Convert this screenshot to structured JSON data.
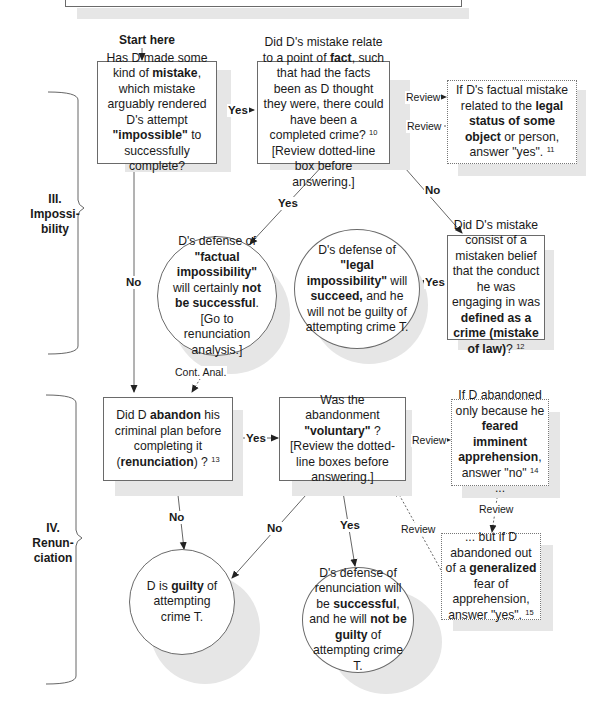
{
  "header_box": {
    "visible_text": ""
  },
  "start": {
    "label": "Start here"
  },
  "sections": [
    {
      "id": "III",
      "number": "III.",
      "title_line1": "Impossi-",
      "title_line2": "bility"
    },
    {
      "id": "IV",
      "number": "IV.",
      "title_line1": "Renun-",
      "title_line2": "ciation"
    }
  ],
  "nodes": {
    "q_mistake": {
      "t1": "Has D made some kind of ",
      "b1": "mistake",
      "t2": ", which mistake arguably rendered D's attempt ",
      "b2": "\"impossible\"",
      "t3": " to successfully complete?"
    },
    "q_fact": {
      "t1": "Did D's mistake relate to a point of ",
      "b1": "fact",
      "t2": ", such that had the facts been as D thought they were, there could have been a completed crime? ",
      "sup": "10",
      "t3": " [Review dotted-line box before answering.]"
    },
    "note_legal_status": {
      "t1": "If D's factual mistake related to the ",
      "b1": "legal status of some object",
      "t2": " or person, answer \"yes\". ",
      "sup": "11"
    },
    "r_factual": {
      "t1": "D's defense of ",
      "b1": "\"factual impossibility\"",
      "t2": " will certainly ",
      "b2": "not be successful",
      "t3": ". [Go to renunciation analysis.]"
    },
    "r_legal": {
      "t1": "D's defense of ",
      "b1": "\"legal impossibility\"",
      "t2": " will ",
      "b2": "succeed,",
      "t3": " and he will not be guilty of attempting crime T."
    },
    "q_law": {
      "t1": "Did D's mistake consist of a mistaken belief that the conduct he was engaging in was ",
      "b1": "defined as a crime (mistake of law)",
      "t2": "? ",
      "sup": "12"
    },
    "q_abandon": {
      "t1": "Did D ",
      "b1": "abandon",
      "t2": " his criminal plan before completing it (",
      "b2": "renunciation",
      "t3": ") ? ",
      "sup": "13"
    },
    "q_voluntary": {
      "b1": "\"voluntary\"",
      "t1": "Was the abandonment ",
      "t2": " ? [Review the dotted-line boxes before answering.]"
    },
    "note_imminent": {
      "t1": "If D abandoned only because he ",
      "b1": "feared imminent apprehension",
      "t2": ", answer \"no\" ",
      "sup": "14",
      "t3": " ..."
    },
    "note_generalized": {
      "t1": "... but if D abandoned out of a ",
      "b1": "generalized",
      "t2": " fear of apprehension, answer \"yes\". ",
      "sup": "15"
    },
    "r_guilty": {
      "t1": "D is ",
      "b1": "guilty",
      "t2": " of attempting crime T."
    },
    "r_renunciation": {
      "t1": "D's defense of renunciation will be ",
      "b1": "successful",
      "t2": ", and he will ",
      "b2": "not be guilty",
      "t3": " of attempting crime T."
    }
  },
  "edge_labels": {
    "yes_mistake_to_fact": "Yes",
    "review_out": "Review",
    "review_in": "Review",
    "no_fact_to_law": "No",
    "yes_fact_to_factual": "Yes",
    "no_mistake_to_abandon": "No",
    "yes_law_to_legal": "Yes",
    "cont_anal": "Cont. Anal.",
    "yes_abandon_to_voluntary": "Yes",
    "review_to_imminent": "Review",
    "review_imminent_to_generalized": "Review",
    "review_generalized_to_voluntary": "Review",
    "no_abandon_to_guilty": "No",
    "no_voluntary_to_guilty": "No",
    "yes_voluntary_to_renunciation": "Yes"
  },
  "colors": {
    "line": "#555555",
    "border": "#6a6a6a",
    "shadow": "#e6e6e6",
    "text": "#1a1a1a"
  }
}
